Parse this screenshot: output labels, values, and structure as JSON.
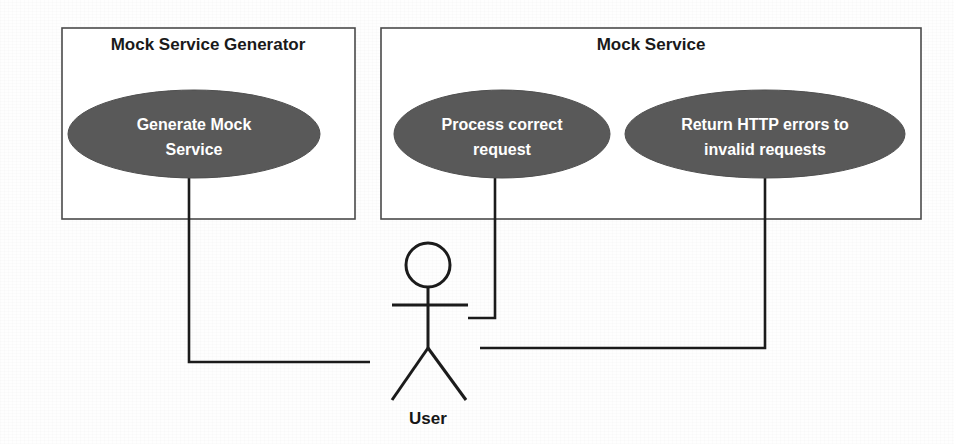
{
  "diagram": {
    "kind": "uml-use-case-diagram",
    "colors": {
      "page_background": "#fefefe",
      "boundary_stroke": "#4a4a4a",
      "boundary_fill": "#ffffff",
      "usecase_fill": "#595959",
      "usecase_stroke": "#4f4f4f",
      "usecase_text": "#ffffff",
      "title_text": "#1a1a1a",
      "association_stroke": "#1b1b1b",
      "actor_stroke": "#1b1b1b"
    },
    "boundaries": [
      {
        "id": "mock-service-generator",
        "title": "Mock Service Generator",
        "x": 62,
        "y": 28,
        "width": 293,
        "height": 191,
        "title_x": 208,
        "title_y": 50
      },
      {
        "id": "mock-service",
        "title": "Mock Service",
        "x": 381,
        "y": 28,
        "width": 540,
        "height": 191,
        "title_x": 651,
        "title_y": 50
      }
    ],
    "use_cases": [
      {
        "id": "generate-mock-service",
        "label": "Generate Mock Service",
        "lines": [
          "Generate Mock",
          "Service"
        ],
        "cx": 194,
        "cy": 134,
        "rx": 126,
        "ry": 44
      },
      {
        "id": "process-correct-request",
        "label": "Process correct request",
        "lines": [
          "Process correct",
          "request"
        ],
        "cx": 502,
        "cy": 134,
        "rx": 108,
        "ry": 44
      },
      {
        "id": "return-http-errors",
        "label": "Return HTTP errors to invalid requests",
        "lines": [
          "Return HTTP errors to",
          "invalid requests"
        ],
        "cx": 765,
        "cy": 134,
        "rx": 140,
        "ry": 44
      }
    ],
    "actors": [
      {
        "id": "user",
        "label": "User",
        "head_cx": 428,
        "head_cy": 265,
        "head_r": 22,
        "body_top": 287,
        "body_bottom": 348,
        "arm_y": 305,
        "arm_left_x": 392,
        "arm_right_x": 468,
        "leg_left_x": 392,
        "leg_right_x": 466,
        "leg_bottom_y": 400,
        "label_x": 428,
        "label_y": 424
      }
    ],
    "associations": [
      {
        "id": "assoc-generate-mock-service-user",
        "from": "generate-mock-service",
        "to": "user",
        "points": "189,172 189,362 370,362"
      },
      {
        "id": "assoc-process-correct-request-user",
        "from": "process-correct-request",
        "to": "user",
        "points": "495,172 495,318 468,318"
      },
      {
        "id": "assoc-return-http-errors-user",
        "from": "return-http-errors",
        "to": "user",
        "points": "765,172 765,348 480,348"
      }
    ]
  }
}
